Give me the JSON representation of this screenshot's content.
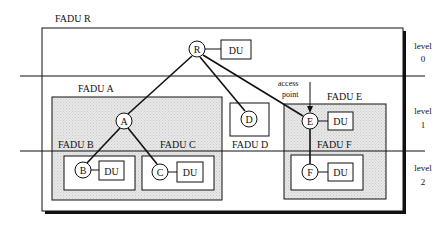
{
  "diagram": {
    "fadu_r": {
      "label": "FADU R",
      "node": "R",
      "du": "DU"
    },
    "fadu_a": {
      "label": "FADU A",
      "node": "A"
    },
    "fadu_b": {
      "label": "FADU B",
      "node": "B",
      "du": "DU"
    },
    "fadu_c": {
      "label": "FADU C",
      "node": "C",
      "du": "DU"
    },
    "fadu_d": {
      "label": "FADU D",
      "node": "D"
    },
    "fadu_e": {
      "label": "FADU E",
      "node": "E",
      "du": "DU"
    },
    "fadu_f": {
      "label": "FADU F",
      "node": "F",
      "du": "DU"
    },
    "access_point": {
      "line1": "access",
      "line2": "point"
    },
    "levels": [
      {
        "word": "level",
        "num": "0"
      },
      {
        "word": "level",
        "num": "1"
      },
      {
        "word": "level",
        "num": "2"
      }
    ],
    "colors": {
      "stroke": "#111111",
      "shade": "#e4e4e4",
      "background": "#ffffff"
    }
  }
}
